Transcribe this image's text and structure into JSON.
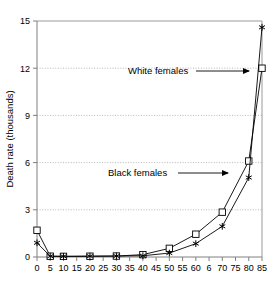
{
  "chart_data": {
    "type": "line",
    "title": "",
    "xlabel": "",
    "ylabel": "Death rate (thousands)",
    "xlim": [
      0,
      85
    ],
    "ylim": [
      0,
      15
    ],
    "grid": true,
    "legend_position": "annotations-inline",
    "x": [
      0,
      5,
      10,
      20,
      30,
      40,
      50,
      60,
      70,
      80,
      85
    ],
    "xticks": [
      "0",
      "5",
      "10",
      "15",
      "20",
      "25",
      "30",
      "35",
      "40",
      "45",
      "50",
      "55",
      "60",
      "6",
      "70",
      "75",
      "80",
      "85"
    ],
    "xtick_values": [
      0,
      5,
      10,
      15,
      20,
      25,
      30,
      35,
      40,
      45,
      50,
      55,
      60,
      65,
      70,
      75,
      80,
      85
    ],
    "yticks": [
      "0",
      "3",
      "6",
      "9",
      "12",
      "15"
    ],
    "ytick_values": [
      0,
      3,
      6,
      9,
      12,
      15
    ],
    "series": [
      {
        "name": "White females",
        "marker": "square",
        "values": [
          1.7,
          0.05,
          0.04,
          0.05,
          0.06,
          0.15,
          0.55,
          1.45,
          2.85,
          6.1,
          12.0
        ]
      },
      {
        "name": "Black females",
        "marker": "star",
        "values": [
          0.9,
          0.05,
          0.04,
          0.05,
          0.06,
          0.08,
          0.25,
          0.85,
          1.95,
          5.05,
          14.6
        ]
      }
    ],
    "annotations": [
      {
        "label": "White females",
        "text_x": 128,
        "text_y": 74,
        "arrow_from_x": 196,
        "arrow_from_y": 71,
        "arrow_to_x": 249,
        "arrow_to_y": 71
      },
      {
        "label": "Black females",
        "text_x": 108,
        "text_y": 176,
        "arrow_from_x": 178,
        "arrow_from_y": 173,
        "arrow_to_x": 228,
        "arrow_to_y": 173
      }
    ],
    "colors": {
      "line": "#000000",
      "grid": "#999999",
      "axis": "#808080",
      "marker_fill": "#ffffff",
      "text": "#000000"
    }
  }
}
